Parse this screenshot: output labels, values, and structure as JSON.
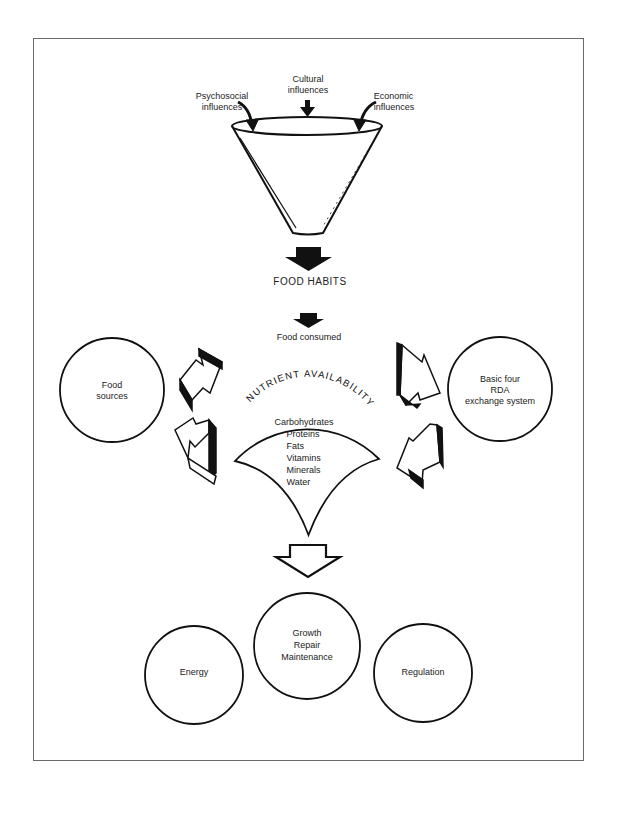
{
  "diagram": {
    "title": "",
    "influences": {
      "psychosocial": [
        "Psychosocial",
        "influences"
      ],
      "cultural": [
        "Cultural",
        "influences"
      ],
      "economic": [
        "Economic",
        "influences"
      ]
    },
    "funnel_output": "FOOD HABITS",
    "food_consumed": "Food consumed",
    "left_circle": [
      "Food",
      "sources"
    ],
    "right_circle": [
      "Basic four",
      "RDA",
      "exchange system"
    ],
    "nutrient_arc_title": "NUTRIENT AVAILABILITY",
    "nutrients": [
      "Carbohydrates",
      "Proteins",
      "Fats",
      "Vitamins",
      "Minerals",
      "Water"
    ],
    "outcomes": {
      "energy": [
        "Energy"
      ],
      "growth": [
        "Growth",
        "Repair",
        "Maintenance"
      ],
      "regulation": [
        "Regulation"
      ]
    },
    "colors": {
      "ink": "#111111",
      "frame": "#6a6a6a",
      "background": "#ffffff"
    }
  }
}
